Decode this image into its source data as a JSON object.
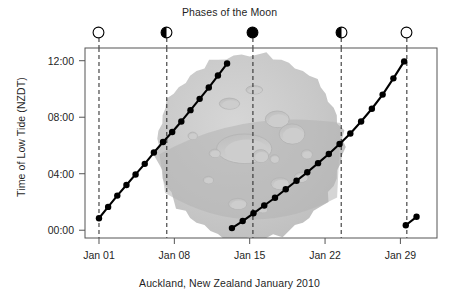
{
  "chart_data": {
    "type": "line",
    "title": "Phases of the Moon",
    "caption": "Auckland, New Zealand January 2010",
    "xlabel": "",
    "ylabel": "Time of Low Tide (NZDT)",
    "x_tick_labels": [
      "Jan 01",
      "Jan 08",
      "Jan 15",
      "Jan 22",
      "Jan 29"
    ],
    "x_tick_days": [
      1,
      8,
      15,
      22,
      29
    ],
    "y_tick_labels": [
      "00:00",
      "04:00",
      "08:00",
      "12:00"
    ],
    "y_tick_values": [
      0,
      4,
      8,
      12
    ],
    "xlim": [
      -0.3,
      32.4
    ],
    "ylim": [
      -0.55,
      12.9
    ],
    "grid": false,
    "legend": false,
    "line_color": "#000000",
    "marker": "filled-circle",
    "marker_size": 3.2,
    "dashed_guide_color": "#222222",
    "series": [
      {
        "name": "Low tide cycle 1",
        "x": [
          1.0,
          1.85,
          2.7,
          3.55,
          4.4,
          5.25,
          6.1,
          6.95,
          7.8,
          8.65,
          9.5,
          10.35,
          11.2,
          12.05,
          12.9
        ],
        "y": [
          0.85,
          1.65,
          2.45,
          3.2,
          3.95,
          4.7,
          5.5,
          6.25,
          6.95,
          7.7,
          8.5,
          9.3,
          10.1,
          10.95,
          11.8
        ]
      },
      {
        "name": "Low tide cycle 2",
        "x": [
          13.35,
          14.35,
          15.35,
          16.35,
          17.35,
          18.35,
          19.35,
          20.35,
          21.35,
          22.35,
          23.35,
          24.35,
          25.35,
          26.35,
          27.35,
          28.35,
          29.35
        ],
        "y": [
          0.15,
          0.65,
          1.2,
          1.75,
          2.3,
          2.9,
          3.5,
          4.1,
          4.75,
          5.4,
          6.1,
          6.85,
          7.7,
          8.6,
          9.6,
          10.75,
          11.95
        ]
      },
      {
        "name": "Low tide cycle 3",
        "x": [
          29.5,
          30.5
        ],
        "y": [
          0.35,
          0.95
        ]
      }
    ],
    "moon_phases": [
      {
        "label": "New Moon",
        "icon": "moon-open-circle",
        "fill": "none",
        "day": 1.0
      },
      {
        "label": "First Quarter",
        "icon": "moon-half-left-dark",
        "fill": "left",
        "day": 7.3
      },
      {
        "label": "Full Moon",
        "icon": "moon-filled-circle",
        "fill": "full",
        "day": 15.3
      },
      {
        "label": "Last Quarter",
        "icon": "moon-half-left-dark",
        "fill": "left",
        "day": 23.5
      },
      {
        "label": "New Moon",
        "icon": "moon-open-circle",
        "fill": "none",
        "day": 29.6
      }
    ],
    "moon_image": {
      "present": true,
      "description": "gray cratered moon photograph watermark behind plot",
      "base_color": "#c9c9c9",
      "shadow_color": "#b2b2b2",
      "center_day": 15.0,
      "center_time": 5.9,
      "radius_px": 92
    }
  }
}
